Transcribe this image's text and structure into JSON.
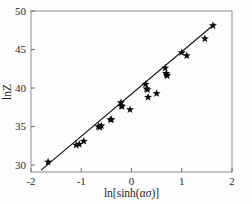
{
  "figure": {
    "background_color": "#fdfdfd",
    "frame_color": "#8d8d8d",
    "marker_color": "#0a0a0a",
    "line_color": "#111111"
  },
  "axes": {
    "x_title_parts": {
      "prefix": "ln[sinh(",
      "alpha": "α",
      "sigma": "σ",
      "suffix": ")]"
    },
    "x_title_full": "ln[sinh(ασ)]",
    "y_title": "lnZ",
    "x_tick_labels": [
      "-2",
      "-1",
      "0",
      "1",
      "2"
    ],
    "y_tick_labels": [
      "30",
      "35",
      "40",
      "45",
      "50"
    ]
  },
  "chart_data": {
    "type": "scatter",
    "title": "",
    "xlabel": "ln[sinh(ασ)]",
    "ylabel": "lnZ",
    "xlim": [
      -2,
      2
    ],
    "ylim": [
      29.1,
      50
    ],
    "xticks": [
      -2,
      -1,
      0,
      1,
      2
    ],
    "yticks": [
      30,
      35,
      40,
      45,
      50
    ],
    "grid": false,
    "legend": null,
    "marker": "star",
    "series": [
      {
        "name": "experimental data",
        "x": [
          -1.66,
          -1.1,
          -1.04,
          -0.95,
          -0.66,
          -0.63,
          -0.6,
          -0.42,
          -0.4,
          -0.21,
          -0.2,
          -0.19,
          -0.03,
          0.28,
          0.3,
          0.32,
          0.33,
          0.5,
          0.67,
          0.69,
          0.7,
          0.71,
          1.0,
          1.1,
          1.46,
          1.62
        ],
        "y": [
          30.4,
          32.6,
          32.7,
          33.1,
          35.0,
          34.9,
          35.1,
          35.9,
          35.9,
          38.1,
          37.7,
          37.6,
          37.2,
          40.5,
          39.9,
          39.8,
          38.8,
          39.3,
          42.6,
          41.9,
          41.7,
          41.6,
          44.6,
          44.2,
          46.4,
          48.1
        ]
      }
    ],
    "fit_line": {
      "name": "linear regression fit",
      "x_start": -1.8,
      "y_start": 29.35,
      "x_end": 1.66,
      "y_end": 48.35
    }
  }
}
